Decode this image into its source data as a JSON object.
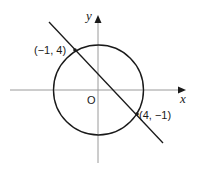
{
  "diagram": {
    "axes": {
      "x_label": "x",
      "y_label": "y",
      "origin_label": "O"
    },
    "points": [
      {
        "label": "(−1, 4)",
        "x": -1,
        "y": 4
      },
      {
        "label": "(4, −1)",
        "x": 4,
        "y": -1
      }
    ],
    "shapes": [
      "circle",
      "line"
    ],
    "colors": {
      "axis": "#9a9a9a",
      "stroke": "#1a1a1a",
      "background": "#ffffff"
    }
  }
}
